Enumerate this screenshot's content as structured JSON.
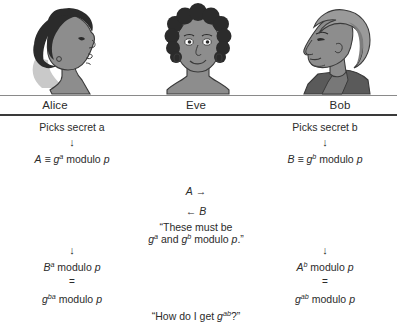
{
  "diagram": {
    "participants": [
      {
        "id": "alice",
        "name": "Alice",
        "icon": "woman-profile-portrait"
      },
      {
        "id": "eve",
        "name": "Eve",
        "icon": "woman-front-portrait"
      },
      {
        "id": "bob",
        "name": "Bob",
        "icon": "man-profile-portrait"
      }
    ],
    "alice": {
      "picks_secret": "Picks secret a",
      "arrow_down_1": "↓",
      "public_value": "A ≡ g a modulo p",
      "arrow_down_2": "↓",
      "shared_1": "B a modulo p",
      "equals": "=",
      "shared_2": "g ba modulo p"
    },
    "bob": {
      "picks_secret": "Picks secret b",
      "arrow_down_1": "↓",
      "public_value": "B ≡ g b modulo p",
      "arrow_down_2": "↓",
      "shared_1": "A b modulo p",
      "equals": "=",
      "shared_2": "g ab modulo p"
    },
    "eve": {
      "intercept_a": "A →",
      "intercept_b": "← B",
      "quote_line_1": "“These must be",
      "quote_line_2": "g a and g b modulo p.”",
      "question": "“How do I get g ab ?”"
    },
    "colors": {
      "text": "#2b2b2b",
      "rule_thin": "#8a8a8a",
      "rule_thick": "#3a3a3a",
      "hair_dark": "#2b2b2b",
      "skin_grey": "#8d8d8d",
      "hair_light": "#9a9a9a",
      "background": "#ffffff"
    }
  }
}
